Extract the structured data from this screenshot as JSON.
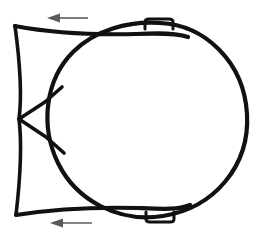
{
  "canvas": {
    "width": 262,
    "height": 242,
    "background_color": "#ffffff",
    "title": "Line drawing of a circular body with bracket and flow arrows"
  },
  "style": {
    "stroke_color": "#111111",
    "stroke_color_hex": "#111111",
    "arrow_color": "#5a5a5a",
    "arrow_color_hex": "#5a5a5a",
    "main_stroke_width": 4.2,
    "bracket_stroke_width": 3.6,
    "tab_stroke_width": 3.0,
    "arrow_stroke_width": 1.6,
    "fill": "none"
  },
  "chart_data": {
    "type": "diagram",
    "title": "",
    "xlabel": "",
    "ylabel": "",
    "grid": false,
    "legend": null,
    "annotations": [
      {
        "name": "top-flow-arrow",
        "direction": "left",
        "x_from": 88,
        "x_to": 47,
        "y": 18
      },
      {
        "name": "bottom-flow-arrow",
        "direction": "left",
        "x_from": 92,
        "x_to": 50,
        "y": 223
      }
    ]
  },
  "shapes": {
    "body_circle": {
      "label": "main-circular-body",
      "center_x": 145,
      "center_y": 120,
      "radius_x": 102,
      "radius_y": 97,
      "description": "Large closed rounded body forming the right portion of the figure"
    },
    "left_bracket": {
      "label": "left-vertical-bracket",
      "top_corner_x": 15,
      "top_corner_y": 26,
      "bottom_corner_x": 16,
      "bottom_corner_y": 215,
      "spine_x": 19,
      "vertex_x": 19,
      "vertex_y": 119,
      "description": "Slightly bowed vertical spine with flared corners top and bottom"
    },
    "upper_taper": {
      "label": "upper-concave-taper",
      "start_x": 15,
      "start_y": 26,
      "end_x": 186,
      "end_y": 36,
      "description": "Concave curve sweeping from top-left corner to tangency on the circle"
    },
    "lower_taper": {
      "label": "lower-concave-taper",
      "start_x": 16,
      "start_y": 215,
      "end_x": 188,
      "end_y": 207,
      "description": "Concave curve sweeping from bottom-left corner to tangency on the circle"
    },
    "upper_vertex_arm": {
      "label": "upper-vertex-arm",
      "start_x": 19,
      "start_y": 119,
      "end_x": 62,
      "end_y": 88,
      "description": "Short straight arm from the central vertex up-right to the body outline"
    },
    "lower_vertex_arm": {
      "label": "lower-vertex-arm",
      "start_x": 19,
      "start_y": 119,
      "end_x": 64,
      "end_y": 152,
      "description": "Short straight arm from the central vertex down-right to the body outline"
    },
    "top_tab": {
      "label": "top-mounting-tab",
      "x_left": 146,
      "x_right": 172,
      "y_top": 19,
      "y_bottom": 29,
      "description": "Small rounded rectangular tab protruding above the circle"
    },
    "bottom_tab": {
      "label": "bottom-mounting-tab",
      "x_left": 146,
      "x_right": 174,
      "y_top": 212,
      "y_bottom": 222,
      "description": "Small rounded rectangular tab protruding below the circle"
    }
  }
}
